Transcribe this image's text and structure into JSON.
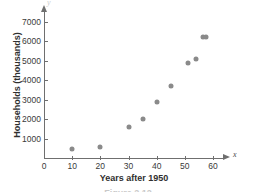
{
  "chart_data": {
    "type": "scatter",
    "title": "",
    "xlabel": "Years after 1950",
    "ylabel": "Households (thousands)",
    "x_var_label": "x",
    "y_var_label": "y",
    "xlim": [
      0,
      63
    ],
    "ylim": [
      0,
      7300
    ],
    "grid": false,
    "legend": null,
    "xticks": [
      0,
      10,
      20,
      30,
      40,
      50,
      60
    ],
    "xtick_labels": [
      "0",
      "10",
      "20",
      "30",
      "40",
      "50",
      "60"
    ],
    "yticks": [
      1000,
      2000,
      3000,
      4000,
      5000,
      6000,
      7000
    ],
    "ytick_labels": [
      "1000",
      "2000",
      "3000",
      "4000",
      "5000",
      "6000",
      "7000"
    ],
    "marker_color": "#8a8a8a",
    "axis_color": "#6f6f6f",
    "points": [
      {
        "x": 10,
        "y": 450
      },
      {
        "x": 20,
        "y": 550
      },
      {
        "x": 30,
        "y": 1600
      },
      {
        "x": 35,
        "y": 2000
      },
      {
        "x": 40,
        "y": 2900
      },
      {
        "x": 45,
        "y": 3700
      },
      {
        "x": 51,
        "y": 4900
      },
      {
        "x": 54,
        "y": 5100
      },
      {
        "x": 56.5,
        "y": 6250
      },
      {
        "x": 57.5,
        "y": 6250
      }
    ]
  },
  "caption": "Figure 2.12"
}
